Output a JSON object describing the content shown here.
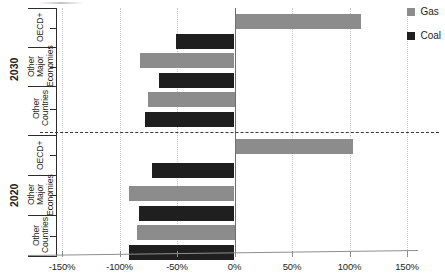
{
  "chart_data": {
    "type": "bar",
    "orientation": "horizontal",
    "title": "",
    "subtitle": "",
    "xlabel": "",
    "ylabel": "",
    "xlim": [
      -150,
      150
    ],
    "xticks": [
      -150,
      -100,
      -50,
      0,
      50,
      100,
      150
    ],
    "xtick_labels": [
      "-150%",
      "-100%",
      "-50%",
      "0%",
      "50%",
      "100%",
      "150%"
    ],
    "grid": true,
    "grid_axis": "x",
    "legend": {
      "position": "top-right",
      "entries": [
        {
          "name": "Gas",
          "color": "#8c8c8c"
        },
        {
          "name": "Coal",
          "color": "#201f1f"
        }
      ]
    },
    "groups": [
      {
        "name": "2030",
        "categories": [
          "OECD+",
          "Other Major Economies",
          "Other Countries"
        ],
        "series": [
          {
            "name": "Gas",
            "values": [
              110,
              -82,
              -75
            ]
          },
          {
            "name": "Coal",
            "values": [
              -51,
              -66,
              -78
            ]
          }
        ]
      },
      {
        "name": "2020",
        "categories": [
          "OECD+",
          "Other Major Economies",
          "Other Countries"
        ],
        "series": [
          {
            "name": "Gas",
            "values": [
              103,
              -92,
              -85
            ]
          },
          {
            "name": "Coal",
            "values": [
              -72,
              -83,
              -92
            ]
          }
        ]
      }
    ],
    "bars": [
      {
        "group": "2030",
        "category": "OECD+",
        "series": "Gas",
        "value": 110
      },
      {
        "group": "2030",
        "category": "OECD+",
        "series": "Coal",
        "value": -51
      },
      {
        "group": "2030",
        "category": "Other Major Economies",
        "series": "Gas",
        "value": -82
      },
      {
        "group": "2030",
        "category": "Other Major Economies",
        "series": "Coal",
        "value": -66
      },
      {
        "group": "2030",
        "category": "Other Countries",
        "series": "Gas",
        "value": -75
      },
      {
        "group": "2030",
        "category": "Other Countries",
        "series": "Coal",
        "value": -78
      },
      {
        "group": "2020",
        "category": "OECD+",
        "series": "Gas",
        "value": 103
      },
      {
        "group": "2020",
        "category": "OECD+",
        "series": "Coal",
        "value": -72
      },
      {
        "group": "2020",
        "category": "Other Major Economies",
        "series": "Gas",
        "value": -92
      },
      {
        "group": "2020",
        "category": "Other Major Economies",
        "series": "Coal",
        "value": -83
      },
      {
        "group": "2020",
        "category": "Other Countries",
        "series": "Gas",
        "value": -85
      },
      {
        "group": "2020",
        "category": "Other Countries",
        "series": "Coal",
        "value": -92
      }
    ]
  },
  "axis": {
    "x_tick_labels": [
      "-150%",
      "-100%",
      "-50%",
      "0%",
      "50%",
      "100%",
      "150%"
    ],
    "group_labels": [
      "2030",
      "2020"
    ],
    "category_labels": [
      "OECD+",
      "Other Major Economies",
      "Other Countries"
    ]
  },
  "legend": {
    "gas_label": "Gas",
    "coal_label": "Coal"
  },
  "colors": {
    "gas": "#8c8c8c",
    "coal": "#201f1f",
    "axis": "#2b2b2b",
    "grid": "#c9c9c9",
    "text": "#231f20"
  }
}
